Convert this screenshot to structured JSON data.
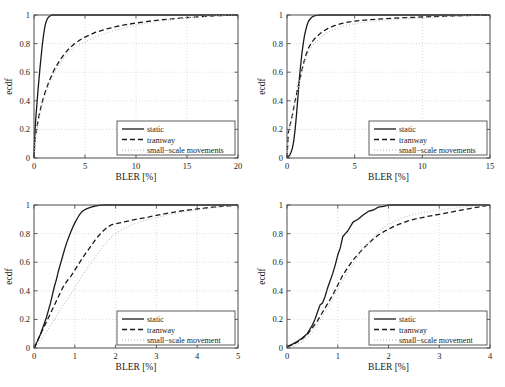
{
  "figure": {
    "background": "#ffffff",
    "axis_color": "#4d4d4d",
    "grid_color": "#cfcfcf"
  },
  "series_styles": {
    "static": {
      "color": "#1a1a1a",
      "dash": "none",
      "width": 1.3
    },
    "tramway": {
      "color": "#1a1a1a",
      "dash": "5,3",
      "width": 1.3
    },
    "small_scale": {
      "color": "#c8c8c8",
      "dash": "1,2",
      "width": 1.3
    }
  },
  "chart_data": [
    {
      "type": "line",
      "panel": "top-left",
      "title": "",
      "xlabel": "BLER [%]",
      "ylabel": "ecdf",
      "xlim": [
        0,
        20
      ],
      "ylim": [
        0,
        1
      ],
      "xticks": [
        0,
        5,
        10,
        15,
        20
      ],
      "xticklabels": [
        "0",
        "5",
        "10",
        "15",
        "20"
      ],
      "yticks": [
        0,
        0.2,
        0.4,
        0.6,
        0.8,
        1
      ],
      "yticklabels": [
        "0",
        "0.2",
        "0.4",
        "0.6",
        "0.8",
        "1"
      ],
      "grid": true,
      "legend_position": "lower right",
      "legend": [
        "static",
        "tramway",
        "small−scale movements"
      ],
      "series": [
        {
          "name": "static",
          "x": [
            0,
            0.05,
            0.1,
            0.2,
            0.3,
            0.4,
            0.5,
            0.6,
            0.7,
            0.8,
            0.9,
            1.0,
            1.1,
            1.2,
            1.3,
            1.4,
            1.5,
            1.6,
            1.7,
            1.8,
            2.0,
            3.0,
            5.0,
            10.0,
            15.0,
            20.0
          ],
          "y": [
            0.0,
            0.1,
            0.2,
            0.3,
            0.39,
            0.48,
            0.56,
            0.64,
            0.71,
            0.78,
            0.84,
            0.89,
            0.93,
            0.955,
            0.972,
            0.983,
            0.99,
            0.995,
            0.998,
            1.0,
            1.0,
            1.0,
            1.0,
            1.0,
            1.0,
            1.0
          ]
        },
        {
          "name": "tramway",
          "x": [
            0,
            0.1,
            0.3,
            0.5,
            0.8,
            1.0,
            1.5,
            2.0,
            2.5,
            3.0,
            3.5,
            4.0,
            4.5,
            5.0,
            6.0,
            7.0,
            8.0,
            9.0,
            10.0,
            11.0,
            12.0,
            13.0,
            14.0,
            15.0,
            16.0,
            17.0,
            18.0,
            19.0,
            20.0
          ],
          "y": [
            0.0,
            0.14,
            0.22,
            0.3,
            0.39,
            0.44,
            0.54,
            0.62,
            0.68,
            0.73,
            0.77,
            0.8,
            0.825,
            0.845,
            0.878,
            0.9,
            0.918,
            0.932,
            0.944,
            0.954,
            0.963,
            0.97,
            0.976,
            0.982,
            0.987,
            0.991,
            0.995,
            0.998,
            1.0
          ]
        },
        {
          "name": "small−scale movements",
          "x": [
            0,
            0.1,
            0.3,
            0.5,
            0.8,
            1.0,
            1.5,
            2.0,
            2.5,
            3.0,
            3.5,
            4.0,
            4.5,
            5.0,
            6.0,
            7.0,
            8.0,
            9.0,
            10.0,
            11.0,
            12.0,
            13.0,
            14.0,
            15.0,
            16.0,
            17.0,
            18.0,
            19.0,
            20.0
          ],
          "y": [
            0.0,
            0.12,
            0.2,
            0.28,
            0.37,
            0.42,
            0.52,
            0.6,
            0.655,
            0.705,
            0.742,
            0.772,
            0.795,
            0.812,
            0.845,
            0.872,
            0.893,
            0.912,
            0.928,
            0.942,
            0.954,
            0.964,
            0.973,
            0.981,
            0.987,
            0.992,
            0.996,
            0.999,
            1.0
          ]
        }
      ]
    },
    {
      "type": "line",
      "panel": "top-right",
      "title": "",
      "xlabel": "BLER [%]",
      "ylabel": "ecdf",
      "xlim": [
        0,
        15
      ],
      "ylim": [
        0,
        1
      ],
      "xticks": [
        0,
        5,
        10,
        15
      ],
      "xticklabels": [
        "0",
        "5",
        "10",
        "15"
      ],
      "yticks": [
        0,
        0.2,
        0.4,
        0.6,
        0.8,
        1
      ],
      "yticklabels": [
        "0",
        "0.2",
        "0.4",
        "0.6",
        "0.8",
        "1"
      ],
      "grid": true,
      "legend_position": "lower right",
      "legend": [
        "static",
        "tramway",
        "small−scale movements"
      ],
      "series": [
        {
          "name": "static",
          "x": [
            0,
            0.1,
            0.2,
            0.3,
            0.4,
            0.5,
            0.6,
            0.7,
            0.8,
            0.9,
            1.0,
            1.1,
            1.2,
            1.3,
            1.4,
            1.5,
            1.6,
            1.8,
            2.0,
            2.2,
            2.5,
            3.0,
            5.0,
            10.0,
            15.0
          ],
          "y": [
            0.0,
            0.01,
            0.02,
            0.04,
            0.07,
            0.12,
            0.2,
            0.3,
            0.42,
            0.54,
            0.64,
            0.73,
            0.8,
            0.86,
            0.9,
            0.935,
            0.958,
            0.982,
            0.994,
            0.998,
            1.0,
            1.0,
            1.0,
            1.0,
            1.0
          ]
        },
        {
          "name": "tramway",
          "x": [
            0,
            0.1,
            0.2,
            0.4,
            0.6,
            0.8,
            1.0,
            1.2,
            1.4,
            1.6,
            1.8,
            2.0,
            2.5,
            3.0,
            3.5,
            4.0,
            4.5,
            5.0,
            6.0,
            7.0,
            8.0,
            9.0,
            10.0,
            11.0,
            12.0,
            13.0,
            14.0,
            15.0
          ],
          "y": [
            0.0,
            0.18,
            0.22,
            0.3,
            0.4,
            0.49,
            0.57,
            0.655,
            0.72,
            0.77,
            0.805,
            0.83,
            0.875,
            0.905,
            0.925,
            0.94,
            0.95,
            0.957,
            0.966,
            0.973,
            0.978,
            0.982,
            0.986,
            0.989,
            0.992,
            0.995,
            0.998,
            1.0
          ]
        },
        {
          "name": "small−scale movements",
          "x": [
            0,
            0.1,
            0.2,
            0.4,
            0.6,
            0.8,
            1.0,
            1.2,
            1.4,
            1.6,
            1.8,
            2.0,
            2.5,
            3.0,
            3.5,
            4.0,
            4.5,
            5.0,
            6.0,
            7.0,
            8.0,
            9.0,
            10.0,
            11.0,
            12.0,
            13.0,
            14.0,
            15.0
          ],
          "y": [
            0.0,
            0.17,
            0.21,
            0.29,
            0.385,
            0.475,
            0.56,
            0.64,
            0.7,
            0.745,
            0.775,
            0.8,
            0.845,
            0.878,
            0.9,
            0.918,
            0.93,
            0.94,
            0.953,
            0.962,
            0.969,
            0.975,
            0.98,
            0.985,
            0.99,
            0.994,
            0.997,
            1.0
          ]
        }
      ]
    },
    {
      "type": "line",
      "panel": "bottom-left",
      "title": "",
      "xlabel": "BLER [%]",
      "ylabel": "ecdf",
      "xlim": [
        0,
        5
      ],
      "ylim": [
        0,
        1
      ],
      "xticks": [
        0,
        1,
        2,
        3,
        4,
        5
      ],
      "xticklabels": [
        "0",
        "1",
        "2",
        "3",
        "4",
        "5"
      ],
      "yticks": [
        0,
        0.2,
        0.4,
        0.6,
        0.8,
        1
      ],
      "yticklabels": [
        "0",
        "0.2",
        "0.4",
        "0.6",
        "0.8",
        "1"
      ],
      "grid": true,
      "legend_position": "lower right",
      "legend": [
        "static",
        "tramway",
        "small−scale movement"
      ],
      "series": [
        {
          "name": "static",
          "x": [
            0,
            0.05,
            0.1,
            0.15,
            0.2,
            0.25,
            0.3,
            0.35,
            0.4,
            0.45,
            0.5,
            0.55,
            0.6,
            0.65,
            0.7,
            0.75,
            0.8,
            0.85,
            0.9,
            0.95,
            1.0,
            1.05,
            1.1,
            1.15,
            1.2,
            1.3,
            1.4,
            1.5,
            1.6,
            1.7,
            2.0,
            3.0,
            4.0,
            5.0
          ],
          "y": [
            0.0,
            0.03,
            0.06,
            0.09,
            0.13,
            0.17,
            0.21,
            0.26,
            0.31,
            0.37,
            0.43,
            0.48,
            0.54,
            0.59,
            0.64,
            0.69,
            0.735,
            0.775,
            0.81,
            0.845,
            0.875,
            0.9,
            0.925,
            0.945,
            0.96,
            0.975,
            0.985,
            0.993,
            0.998,
            1.0,
            1.0,
            1.0,
            1.0,
            1.0
          ]
        },
        {
          "name": "tramway",
          "x": [
            0,
            0.05,
            0.1,
            0.2,
            0.3,
            0.4,
            0.5,
            0.6,
            0.7,
            0.8,
            0.9,
            1.0,
            1.1,
            1.2,
            1.3,
            1.4,
            1.5,
            1.6,
            1.7,
            1.8,
            1.9,
            2.0,
            2.2,
            2.5,
            2.8,
            3.0,
            3.3,
            3.6,
            4.0,
            4.3,
            4.6,
            5.0
          ],
          "y": [
            0.0,
            0.02,
            0.06,
            0.12,
            0.18,
            0.24,
            0.3,
            0.36,
            0.42,
            0.465,
            0.5,
            0.545,
            0.59,
            0.635,
            0.675,
            0.715,
            0.755,
            0.79,
            0.82,
            0.845,
            0.862,
            0.868,
            0.882,
            0.9,
            0.915,
            0.928,
            0.944,
            0.958,
            0.972,
            0.982,
            0.99,
            1.0
          ]
        },
        {
          "name": "small−scale movement",
          "x": [
            0,
            0.1,
            0.2,
            0.3,
            0.4,
            0.5,
            0.6,
            0.7,
            0.8,
            0.9,
            1.0,
            1.1,
            1.2,
            1.3,
            1.4,
            1.5,
            1.6,
            1.7,
            1.8,
            1.9,
            2.0,
            2.2,
            2.5,
            2.8,
            3.0,
            3.3,
            3.6,
            4.0,
            4.3,
            4.6,
            5.0
          ],
          "y": [
            0.0,
            0.03,
            0.07,
            0.11,
            0.155,
            0.2,
            0.245,
            0.29,
            0.335,
            0.375,
            0.42,
            0.47,
            0.515,
            0.555,
            0.595,
            0.635,
            0.675,
            0.712,
            0.745,
            0.775,
            0.8,
            0.835,
            0.873,
            0.898,
            0.912,
            0.932,
            0.948,
            0.966,
            0.978,
            0.989,
            1.0
          ]
        }
      ]
    },
    {
      "type": "line",
      "panel": "bottom-right",
      "title": "",
      "xlabel": "BLER [%]",
      "ylabel": "ecdf",
      "xlim": [
        0,
        4
      ],
      "ylim": [
        0,
        1
      ],
      "xticks": [
        0,
        1,
        2,
        3,
        4
      ],
      "xticklabels": [
        "0",
        "1",
        "2",
        "3",
        "4"
      ],
      "yticks": [
        0,
        0.2,
        0.4,
        0.6,
        0.8,
        1
      ],
      "yticklabels": [
        "0",
        "0.2",
        "0.4",
        "0.6",
        "0.8",
        "1"
      ],
      "grid": true,
      "legend_position": "lower right",
      "legend": [
        "static",
        "tramway",
        "small−scale movement"
      ],
      "series": [
        {
          "name": "static",
          "x": [
            0,
            0.1,
            0.2,
            0.3,
            0.4,
            0.45,
            0.5,
            0.55,
            0.6,
            0.65,
            0.7,
            0.75,
            0.8,
            0.85,
            0.9,
            0.95,
            1.0,
            1.05,
            1.1,
            1.15,
            1.2,
            1.3,
            1.4,
            1.5,
            1.6,
            1.7,
            1.8,
            1.9,
            2.0,
            2.5,
            3.0,
            4.0
          ],
          "y": [
            0.01,
            0.025,
            0.045,
            0.07,
            0.1,
            0.13,
            0.16,
            0.2,
            0.25,
            0.3,
            0.315,
            0.36,
            0.42,
            0.47,
            0.52,
            0.58,
            0.65,
            0.7,
            0.78,
            0.8,
            0.82,
            0.88,
            0.9,
            0.93,
            0.955,
            0.965,
            0.985,
            0.99,
            1.0,
            1.0,
            1.0,
            1.0
          ]
        },
        {
          "name": "tramway",
          "x": [
            0,
            0.1,
            0.2,
            0.3,
            0.4,
            0.5,
            0.6,
            0.7,
            0.8,
            0.9,
            1.0,
            1.1,
            1.2,
            1.3,
            1.4,
            1.5,
            1.6,
            1.7,
            1.8,
            1.9,
            2.0,
            2.2,
            2.4,
            2.6,
            2.8,
            3.0,
            3.2,
            3.4,
            3.6,
            3.8,
            4.0
          ],
          "y": [
            0.01,
            0.02,
            0.04,
            0.065,
            0.095,
            0.14,
            0.19,
            0.25,
            0.31,
            0.37,
            0.44,
            0.51,
            0.565,
            0.615,
            0.655,
            0.695,
            0.73,
            0.762,
            0.79,
            0.812,
            0.832,
            0.865,
            0.89,
            0.908,
            0.922,
            0.935,
            0.948,
            0.962,
            0.975,
            0.988,
            1.0
          ]
        },
        {
          "name": "small−scale movement",
          "x": [
            0,
            0.1,
            0.2,
            0.3,
            0.4,
            0.5,
            0.6,
            0.7,
            0.8,
            0.9,
            1.0,
            1.1,
            1.2,
            1.3,
            1.4,
            1.5,
            1.6,
            1.7,
            1.8,
            1.9,
            2.0,
            2.2,
            2.4,
            2.6,
            2.8,
            3.0,
            3.2,
            3.4,
            3.6,
            3.8,
            4.0
          ],
          "y": [
            0.0,
            0.01,
            0.025,
            0.045,
            0.075,
            0.115,
            0.165,
            0.22,
            0.28,
            0.345,
            0.41,
            0.475,
            0.535,
            0.59,
            0.64,
            0.69,
            0.735,
            0.775,
            0.81,
            0.84,
            0.865,
            0.9,
            0.925,
            0.942,
            0.955,
            0.966,
            0.975,
            0.983,
            0.99,
            0.996,
            1.0
          ]
        }
      ]
    }
  ]
}
